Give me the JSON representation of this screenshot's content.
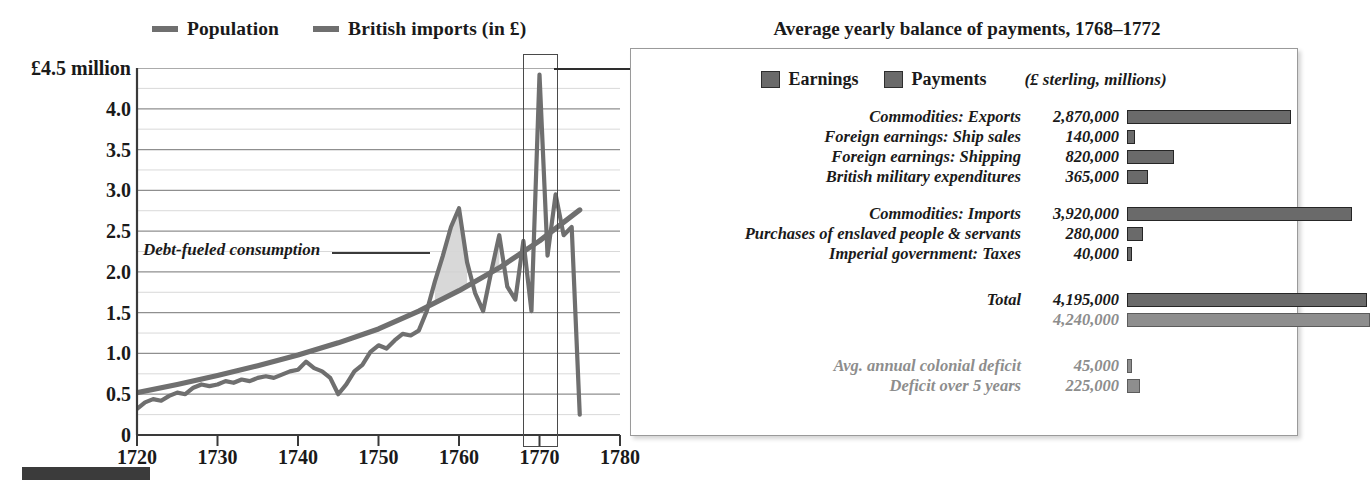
{
  "line_chart": {
    "legend": [
      {
        "label": "Population",
        "color": "#6f6f6f",
        "name": "population"
      },
      {
        "label": "British imports (in £)",
        "color": "#6f6f6f",
        "name": "british-imports"
      }
    ],
    "y_axis": {
      "top_label": "£4.5 million",
      "ticks": [
        "£4.5 million",
        "4.0",
        "3.5",
        "3.0",
        "2.5",
        "2.0",
        "1.5",
        "1.0",
        "0.5",
        "0"
      ],
      "values": [
        4.5,
        4.0,
        3.5,
        3.0,
        2.5,
        2.0,
        1.5,
        1.0,
        0.5,
        0
      ],
      "min": 0,
      "max": 4.5,
      "minor_step": 0.25
    },
    "x_axis": {
      "ticks": [
        "1720",
        "1730",
        "1740",
        "1750",
        "1760",
        "1770",
        "1780"
      ],
      "values": [
        1720,
        1730,
        1740,
        1750,
        1760,
        1770,
        1780
      ],
      "min": 1720,
      "max": 1780
    },
    "annotation": {
      "text": "Debt-fueled consumption",
      "connector": true
    },
    "highlight": {
      "from": 1768,
      "to": 1772,
      "arrow_to_panel": true
    }
  },
  "chart_data": [
    {
      "type": "line",
      "title": "Population and British imports, 1720–1780",
      "xlabel": "",
      "ylabel": "£ millions / population index",
      "xlim": [
        1720,
        1780
      ],
      "ylim": [
        0,
        4.5
      ],
      "grid": true,
      "legend_position": "top",
      "series": [
        {
          "name": "Population",
          "color": "#6f6f6f",
          "x": [
            1720,
            1725,
            1730,
            1735,
            1740,
            1745,
            1750,
            1755,
            1760,
            1765,
            1770,
            1775
          ],
          "values": [
            0.52,
            0.62,
            0.73,
            0.85,
            0.98,
            1.13,
            1.3,
            1.52,
            1.77,
            2.05,
            2.38,
            2.76
          ]
        },
        {
          "name": "British imports (in £)",
          "color": "#6f6f6f",
          "x": [
            1720,
            1721,
            1722,
            1723,
            1724,
            1725,
            1726,
            1727,
            1728,
            1729,
            1730,
            1731,
            1732,
            1733,
            1734,
            1735,
            1736,
            1737,
            1738,
            1739,
            1740,
            1741,
            1742,
            1743,
            1744,
            1745,
            1746,
            1747,
            1748,
            1749,
            1750,
            1751,
            1752,
            1753,
            1754,
            1755,
            1756,
            1757,
            1758,
            1759,
            1760,
            1761,
            1762,
            1763,
            1764,
            1765,
            1766,
            1767,
            1768,
            1769,
            1770,
            1771,
            1772,
            1773,
            1774,
            1775
          ],
          "values": [
            0.32,
            0.4,
            0.44,
            0.42,
            0.48,
            0.52,
            0.5,
            0.58,
            0.62,
            0.6,
            0.62,
            0.66,
            0.64,
            0.68,
            0.66,
            0.7,
            0.72,
            0.7,
            0.74,
            0.78,
            0.8,
            0.9,
            0.82,
            0.78,
            0.7,
            0.5,
            0.62,
            0.78,
            0.86,
            1.02,
            1.1,
            1.06,
            1.16,
            1.24,
            1.22,
            1.28,
            1.52,
            1.88,
            2.2,
            2.55,
            2.78,
            2.12,
            1.74,
            1.52,
            2.0,
            2.45,
            1.82,
            1.66,
            2.38,
            1.52,
            4.42,
            2.2,
            2.95,
            2.45,
            2.55,
            0.25
          ]
        }
      ]
    },
    {
      "type": "bar",
      "title": "Average yearly balance of payments, 1768–1772",
      "units": "(£ sterling, millions)",
      "xlabel": "£ sterling",
      "ylabel": "",
      "orientation": "horizontal",
      "xlim": [
        0,
        4400000
      ],
      "grid": false,
      "legend_position": "top",
      "legend": [
        "Earnings",
        "Payments"
      ],
      "categories": [
        "Commodities: Exports",
        "Foreign earnings: Ship sales",
        "Foreign earnings: Shipping",
        "British military expenditures",
        "Commodities: Imports",
        "Purchases of enslaved people & servants",
        "Imperial government: Taxes",
        "Total (Earnings)",
        "Total (Payments)",
        "Avg. annual colonial deficit",
        "Deficit over 5 years"
      ],
      "values": [
        2870000,
        140000,
        820000,
        365000,
        3920000,
        280000,
        40000,
        4195000,
        4240000,
        45000,
        225000
      ]
    }
  ],
  "panel": {
    "title": "Average yearly balance of payments, 1768–1772",
    "legend": {
      "earnings_label": "Earnings",
      "payments_label": "Payments",
      "units": "(£ sterling, millions)",
      "earnings_color": "#6a6a6a",
      "payments_color": "#6a6a6a"
    },
    "max_value": 4400000,
    "groups": [
      {
        "name": "earnings",
        "rows": [
          {
            "label": "Commodities: Exports",
            "value": "2,870,000",
            "n": 2870000,
            "muted": false
          },
          {
            "label": "Foreign earnings: Ship sales",
            "value": "140,000",
            "n": 140000,
            "muted": false
          },
          {
            "label": "Foreign earnings: Shipping",
            "value": "820,000",
            "n": 820000,
            "muted": false
          },
          {
            "label": "British military expenditures",
            "value": "365,000",
            "n": 365000,
            "muted": false
          }
        ]
      },
      {
        "name": "payments",
        "rows": [
          {
            "label": "Commodities: Imports",
            "value": "3,920,000",
            "n": 3920000,
            "muted": false
          },
          {
            "label": "Purchases of enslaved people & servants",
            "value": "280,000",
            "n": 280000,
            "muted": false
          },
          {
            "label": "Imperial government: Taxes",
            "value": "40,000",
            "n": 40000,
            "muted": false
          }
        ]
      },
      {
        "name": "totals",
        "rows": [
          {
            "label": "Total",
            "value": "4,195,000",
            "n": 4195000,
            "muted": false
          },
          {
            "label": "",
            "value": "4,240,000",
            "n": 4240000,
            "muted": true
          }
        ]
      },
      {
        "name": "deficit",
        "rows": [
          {
            "label": "Avg. annual colonial deficit",
            "value": "45,000",
            "n": 45000,
            "muted": true
          },
          {
            "label": "Deficit over 5 years",
            "value": "225,000",
            "n": 225000,
            "muted": true
          }
        ]
      }
    ]
  },
  "colors": {
    "series": "#6f6f6f",
    "bar_fill": "#6a6a6a",
    "bar_stroke": "#262626",
    "grid_minor": "#d9d9d9",
    "grid_major": "#8f8f8f",
    "axis": "#3a3a3a",
    "panel_border": "#9a9a9a",
    "muted_text": "#8d8d8d"
  }
}
